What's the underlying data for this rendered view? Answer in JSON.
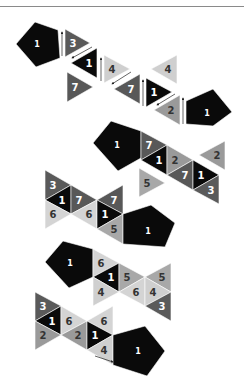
{
  "colors": {
    "c1": "#0a0a0a",
    "c2": "#9a9a9a",
    "c3": "#5a5a5a",
    "c4": "#cfcfcf",
    "c5": "#a8a8a8",
    "c6": "#d4d4d4",
    "c7": "#585858",
    "text_light": "#ffffff",
    "text_dark": "#333333"
  },
  "shapes": [
    {
      "type": "pent",
      "pts": "16,44 35,22 58,30 60,58 36,67",
      "label": "1",
      "lx": 37,
      "ly": 44,
      "fill": "c1",
      "tc": "text_light"
    },
    {
      "type": "tri",
      "pts": "65,29 65,57 90,43",
      "label": "3",
      "lx": 73,
      "ly": 43,
      "fill": "c3",
      "tc": "text_light"
    },
    {
      "type": "tri",
      "pts": "97,48 97,78 71,63",
      "label": "1",
      "lx": 89,
      "ly": 63,
      "fill": "c1",
      "tc": "text_light"
    },
    {
      "type": "tri",
      "pts": "67,72 67,102 93,87",
      "label": "7",
      "lx": 75,
      "ly": 87,
      "fill": "c7",
      "tc": "text_light"
    },
    {
      "type": "tri",
      "pts": "104,55 104,83 130,69",
      "label": "4",
      "lx": 112,
      "ly": 69,
      "fill": "c4",
      "tc": "text_dark"
    },
    {
      "type": "tri",
      "pts": "140,74 140,104 114,89",
      "label": "7",
      "lx": 131,
      "ly": 89,
      "fill": "c7",
      "tc": "text_light"
    },
    {
      "type": "tri",
      "pts": "146,78 146,107 172,92",
      "label": "1",
      "lx": 154,
      "ly": 92,
      "fill": "c1",
      "tc": "text_light"
    },
    {
      "type": "tri",
      "pts": "177,55 177,84 151,69",
      "label": "4",
      "lx": 168,
      "ly": 69,
      "fill": "c4",
      "tc": "text_dark"
    },
    {
      "type": "tri",
      "pts": "180,95 180,125 154,110",
      "label": "2",
      "lx": 171,
      "ly": 110,
      "fill": "c2",
      "tc": "text_dark"
    },
    {
      "type": "pent",
      "pts": "186,101 213,89 232,112 213,126 186,124",
      "label": "1",
      "lx": 207,
      "ly": 113,
      "fill": "c1",
      "tc": "text_light"
    },
    {
      "type": "pent",
      "pts": "93,143 111,121 141,131 141,158 118,171",
      "label": "1",
      "lx": 117,
      "ly": 145,
      "fill": "c1",
      "tc": "text_light"
    },
    {
      "type": "tri",
      "pts": "141,131 141,160 167,145",
      "label": "7",
      "lx": 149,
      "ly": 145,
      "fill": "c7",
      "tc": "text_light"
    },
    {
      "type": "tri",
      "pts": "167,145 167,175 141,160",
      "label": "1",
      "lx": 159,
      "ly": 160,
      "fill": "c1",
      "tc": "text_light"
    },
    {
      "type": "tri",
      "pts": "167,145 167,175 193,160",
      "label": "2",
      "lx": 175,
      "ly": 160,
      "fill": "c2",
      "tc": "text_dark"
    },
    {
      "type": "tri",
      "pts": "193,160 193,190 167,175",
      "label": "7",
      "lx": 185,
      "ly": 175,
      "fill": "c7",
      "tc": "text_light"
    },
    {
      "type": "tri",
      "pts": "193,160 193,190 219,175",
      "label": "1",
      "lx": 201,
      "ly": 175,
      "fill": "c1",
      "tc": "text_light"
    },
    {
      "type": "tri",
      "pts": "219,175 219,204 193,190",
      "label": "3",
      "lx": 211,
      "ly": 190,
      "fill": "c3",
      "tc": "text_light"
    },
    {
      "type": "tri",
      "pts": "225,141 225,170 199,155",
      "label": "2",
      "lx": 217,
      "ly": 155,
      "fill": "c2",
      "tc": "text_dark"
    },
    {
      "type": "tri",
      "pts": "139,168 139,197 165,183",
      "label": "5",
      "lx": 147,
      "ly": 183,
      "fill": "c5",
      "tc": "text_dark"
    },
    {
      "type": "tri",
      "pts": "45,170 45,200 71,185",
      "label": "3",
      "lx": 53,
      "ly": 185,
      "fill": "c3",
      "tc": "text_light"
    },
    {
      "type": "tri",
      "pts": "71,185 71,214 45,200",
      "label": "1",
      "lx": 62,
      "ly": 200,
      "fill": "c1",
      "tc": "text_light"
    },
    {
      "type": "tri",
      "pts": "45,200 45,229 71,214",
      "label": "6",
      "lx": 53,
      "ly": 214,
      "fill": "c6",
      "tc": "text_dark"
    },
    {
      "type": "tri",
      "pts": "71,185 71,214 97,200",
      "label": "7",
      "lx": 79,
      "ly": 200,
      "fill": "c7",
      "tc": "text_light"
    },
    {
      "type": "tri",
      "pts": "97,200 97,229 71,214",
      "label": "6",
      "lx": 89,
      "ly": 214,
      "fill": "c6",
      "tc": "text_dark"
    },
    {
      "type": "tri",
      "pts": "123,185 123,214 97,200",
      "label": "7",
      "lx": 114,
      "ly": 200,
      "fill": "c7",
      "tc": "text_light"
    },
    {
      "type": "tri",
      "pts": "97,200 97,229 123,214",
      "label": "1",
      "lx": 105,
      "ly": 214,
      "fill": "c1",
      "tc": "text_light"
    },
    {
      "type": "tri",
      "pts": "123,214 123,244 97,229",
      "label": "5",
      "lx": 114,
      "ly": 229,
      "fill": "c5",
      "tc": "text_dark"
    },
    {
      "type": "pent",
      "pts": "123,214 151,205 175,223 165,247 123,244",
      "label": "1",
      "lx": 148,
      "ly": 231,
      "fill": "c1",
      "tc": "text_light"
    },
    {
      "type": "pent",
      "pts": "45,262 63,241 93,249 93,277 69,288",
      "label": "1",
      "lx": 70,
      "ly": 263,
      "fill": "c1",
      "tc": "text_light"
    },
    {
      "type": "tri",
      "pts": "93,249 93,277 119,263",
      "label": "6",
      "lx": 101,
      "ly": 263,
      "fill": "c6",
      "tc": "text_dark"
    },
    {
      "type": "tri",
      "pts": "119,263 119,292 93,277",
      "label": "1",
      "lx": 111,
      "ly": 277,
      "fill": "c1",
      "tc": "text_light"
    },
    {
      "type": "tri",
      "pts": "93,277 93,306 119,292",
      "label": "4",
      "lx": 101,
      "ly": 292,
      "fill": "c4",
      "tc": "text_dark"
    },
    {
      "type": "tri",
      "pts": "119,263 119,292 145,277",
      "label": "5",
      "lx": 127,
      "ly": 277,
      "fill": "c5",
      "tc": "text_dark"
    },
    {
      "type": "tri",
      "pts": "145,277 145,306 119,292",
      "label": "6",
      "lx": 136,
      "ly": 292,
      "fill": "c6",
      "tc": "text_dark"
    },
    {
      "type": "tri",
      "pts": "171,263 171,292 145,277",
      "label": "5",
      "lx": 162,
      "ly": 277,
      "fill": "c5",
      "tc": "text_dark"
    },
    {
      "type": "tri",
      "pts": "145,277 145,306 171,292",
      "label": "4",
      "lx": 153,
      "ly": 292,
      "fill": "c4",
      "tc": "text_dark"
    },
    {
      "type": "tri",
      "pts": "171,292 171,321 145,306",
      "label": "3",
      "lx": 162,
      "ly": 306,
      "fill": "c3",
      "tc": "text_light"
    },
    {
      "type": "tri",
      "pts": "35,292 35,321 61,306",
      "label": "3",
      "lx": 43,
      "ly": 306,
      "fill": "c3",
      "tc": "text_light"
    },
    {
      "type": "tri",
      "pts": "61,306 61,335 35,321",
      "label": "1",
      "lx": 52,
      "ly": 321,
      "fill": "c1",
      "tc": "text_light"
    },
    {
      "type": "tri",
      "pts": "35,321 35,350 61,335",
      "label": "2",
      "lx": 43,
      "ly": 335,
      "fill": "c2",
      "tc": "text_dark"
    },
    {
      "type": "tri",
      "pts": "61,306 61,335 87,321",
      "label": "6",
      "lx": 69,
      "ly": 321,
      "fill": "c6",
      "tc": "text_dark"
    },
    {
      "type": "tri",
      "pts": "87,321 87,350 61,335",
      "label": "2",
      "lx": 78,
      "ly": 335,
      "fill": "c2",
      "tc": "text_dark"
    },
    {
      "type": "tri",
      "pts": "113,306 113,335 87,321",
      "label": "6",
      "lx": 104,
      "ly": 321,
      "fill": "c6",
      "tc": "text_dark"
    },
    {
      "type": "tri",
      "pts": "87,321 87,350 113,335",
      "label": "1",
      "lx": 95,
      "ly": 335,
      "fill": "c1",
      "tc": "text_light"
    },
    {
      "type": "tri",
      "pts": "113,335 113,365 87,350",
      "label": "4",
      "lx": 104,
      "ly": 350,
      "fill": "c4",
      "tc": "text_dark"
    },
    {
      "type": "pent",
      "pts": "113,335 145,326 165,351 147,376 113,365",
      "label": "1",
      "lx": 138,
      "ly": 351,
      "fill": "c1",
      "tc": "text_light"
    }
  ],
  "arrows": [
    {
      "x1": 62,
      "y1": 56,
      "x2": 62,
      "y2": 32
    },
    {
      "x1": 92,
      "y1": 47,
      "x2": 72,
      "y2": 58
    },
    {
      "x1": 101,
      "y1": 81,
      "x2": 101,
      "y2": 58
    },
    {
      "x1": 131,
      "y1": 72,
      "x2": 112,
      "y2": 84
    },
    {
      "x1": 143,
      "y1": 106,
      "x2": 143,
      "y2": 80
    },
    {
      "x1": 175,
      "y1": 94,
      "x2": 157,
      "y2": 105
    },
    {
      "x1": 183,
      "y1": 124,
      "x2": 183,
      "y2": 98
    },
    {
      "x1": 95,
      "y1": 356,
      "x2": 113,
      "y2": 362
    }
  ]
}
